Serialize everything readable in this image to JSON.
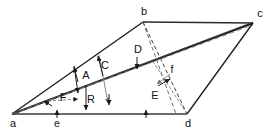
{
  "figure": {
    "type": "geometric-vector-diagram",
    "background_color": "#ffffff",
    "line_color": "#1a1a1a",
    "faint_line_color": "#8a8a8a",
    "width": 272,
    "height": 132,
    "vertices": [
      {
        "id": "a",
        "label": "a",
        "x": 12,
        "y": 114,
        "label_x": 13,
        "label_y": 124
      },
      {
        "id": "b",
        "label": "b",
        "x": 143,
        "y": 22,
        "label_x": 144,
        "label_y": 13
      },
      {
        "id": "c",
        "label": "c",
        "x": 253,
        "y": 23,
        "label_x": 259,
        "label_y": 14
      },
      {
        "id": "d",
        "label": "d",
        "x": 187,
        "y": 114,
        "label_x": 188,
        "label_y": 124
      }
    ],
    "edges": [
      {
        "name": "edge-a-b",
        "from": "a",
        "to": "b",
        "style": "solid",
        "weight": 1.3
      },
      {
        "name": "edge-b-c",
        "from": "b",
        "to": "c",
        "style": "solid",
        "weight": 1.5
      },
      {
        "name": "edge-c-d",
        "from": "c",
        "to": "d",
        "style": "solid",
        "weight": 1.3
      },
      {
        "name": "edge-a-d",
        "from": "a",
        "to": "d",
        "style": "solid",
        "weight": 1.6
      },
      {
        "name": "edge-a-c",
        "from": "a",
        "to": "c",
        "style": "solid",
        "weight": 1.8
      },
      {
        "name": "edge-b-d",
        "from": "b",
        "to": "d",
        "style": "dashed",
        "weight": 1.0
      },
      {
        "name": "diagonal-a-c-construction",
        "from": "a",
        "to": "c",
        "style": "dashed",
        "weight": 1.0
      }
    ],
    "vectors": [
      {
        "name": "vector-A",
        "label": "A",
        "label_x": 86,
        "label_y": 76,
        "tail_x": 74,
        "tail_y": 66,
        "head_x": 78,
        "head_y": 95,
        "style": "solid"
      },
      {
        "name": "vector-C",
        "label": "C",
        "label_x": 104,
        "label_y": 67,
        "tail_x": 99,
        "tail_y": 55,
        "head_x": 109,
        "head_y": 105,
        "style": "faint"
      },
      {
        "name": "vector-D",
        "label": "D",
        "label_x": 139,
        "label_y": 52,
        "tail_x": 137,
        "tail_y": 59,
        "head_x": 137,
        "head_y": 70,
        "style": "solid"
      },
      {
        "name": "vector-E",
        "label": "E",
        "label_x": 156,
        "label_y": 95,
        "tail_x": 168,
        "tail_y": 78,
        "head_x": 156,
        "head_y": 86,
        "style": "faint"
      },
      {
        "name": "vector-F",
        "label": "F",
        "label_x": 63,
        "label_y": 99,
        "tail_x": 48,
        "tail_y": 101,
        "head_x": 80,
        "head_y": 99,
        "style": "dashed"
      },
      {
        "name": "vector-R",
        "label": "R",
        "label_x": 90,
        "label_y": 100,
        "tail_x": 86,
        "tail_y": 88,
        "head_x": 86,
        "head_y": 112,
        "style": "solid"
      },
      {
        "name": "vector-e",
        "label": "e",
        "label_x": 57,
        "label_y": 122,
        "tail_x": 57,
        "tail_y": 118,
        "head_x": 57,
        "head_y": 110,
        "style": "solid"
      },
      {
        "name": "vector-f",
        "label": "f",
        "label_x": 172,
        "label_y": 71,
        "tail_x": 158,
        "tail_y": 85,
        "head_x": 170,
        "head_y": 79,
        "style": "solid"
      }
    ],
    "tick_arrows": [
      {
        "name": "tick-arrow-d-baseline",
        "x": 146,
        "y_tail": 118,
        "y_head": 110
      },
      {
        "name": "tick-arrow-c-down",
        "x": 109,
        "y_tail": 96,
        "y_head": 106
      }
    ]
  }
}
